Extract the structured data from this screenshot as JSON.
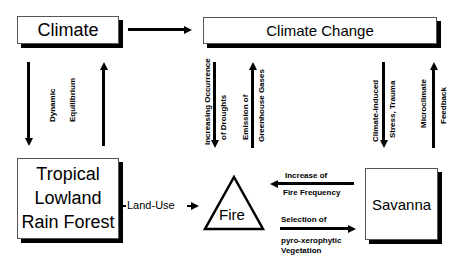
{
  "nodes": {
    "climate": "Climate",
    "climate_change": "Climate Change",
    "forest": [
      "Tropical",
      "Lowland",
      "Rain Forest"
    ],
    "fire": "Fire",
    "savanna": "Savanna"
  },
  "edges": {
    "land_use": "Land-Use",
    "dynamic_equilibrium": [
      "Dynamic",
      "Equilibrium"
    ],
    "droughts": [
      "Increasing Occurrence",
      "of Droughts"
    ],
    "greenhouse": [
      "Emission of",
      "Greenhouse Gases"
    ],
    "stress": [
      "Climate-induced",
      "Stress, Trauma"
    ],
    "microclimate": [
      "Microclimate",
      "Feedback"
    ],
    "fire_frequency": [
      "Increase of",
      "Fire Frequency"
    ],
    "selection": [
      "Selection of",
      "pyro-xerophytic",
      "Vegetation"
    ]
  }
}
